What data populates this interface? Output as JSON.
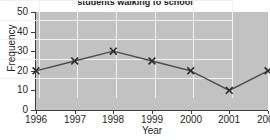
{
  "chart_data": {
    "type": "line",
    "title": "students walking to school",
    "xlabel": "Year",
    "ylabel": "Frequency",
    "categories": [
      "1996",
      "1997",
      "1998",
      "1999",
      "2000",
      "2001",
      "2002"
    ],
    "values": [
      20,
      25,
      30,
      25,
      20,
      10,
      20
    ],
    "series": [
      {
        "name": "students walking to school",
        "values": [
          20,
          25,
          30,
          25,
          20,
          10,
          20
        ]
      }
    ],
    "ylim": [
      0,
      50
    ],
    "yticks": [
      0,
      10,
      20,
      30,
      40,
      50
    ],
    "ytick_labels": [
      "0",
      "10",
      "20",
      "30",
      "40",
      "50"
    ],
    "xtick_labels": [
      "1996",
      "1997",
      "1998",
      "1999",
      "2000",
      "2001",
      "2002"
    ],
    "grid": true,
    "legend": false,
    "marker": "x",
    "colors": {
      "plot_background": "#c2c2c2",
      "page_background": "#ffffff",
      "gridline": "#f2f2f2",
      "axis": "#3c3c3c",
      "line": "#4a4a4a",
      "marker": "#2b2b2b",
      "text": "#262626",
      "title_text": "#1a1a1a"
    }
  }
}
